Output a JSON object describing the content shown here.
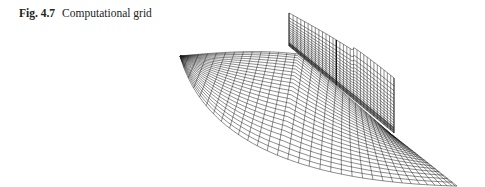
{
  "caption": {
    "figure_label": "Fig. 4.7",
    "title": "Computational grid"
  },
  "figure": {
    "line_color": "#1a1a1a",
    "floor": {
      "corners": {
        "far_left": [
          180,
          56
        ],
        "far_wall": [
          289,
          46
        ],
        "wall_root_near": [
          393,
          133
        ],
        "near_tip": [
          457,
          186
        ],
        "arc_mid": [
          240,
          150
        ]
      },
      "radial_lines": 34,
      "arc_lines": 26
    },
    "wall": {
      "top_far": [
        289,
        13
      ],
      "bottom_far": [
        289,
        46
      ],
      "top_near": [
        394,
        78
      ],
      "bottom_near": [
        394,
        133
      ],
      "seam_fraction": 0.45,
      "columns": 30,
      "rows": 16
    }
  }
}
